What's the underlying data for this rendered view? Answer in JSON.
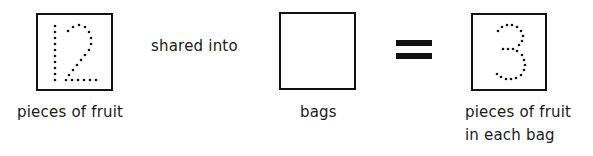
{
  "equation": {
    "dividend": {
      "value": "12",
      "style": "dotted-tracing",
      "label": "pieces of fruit"
    },
    "operator_text": "shared into",
    "divisor": {
      "value": "",
      "style": "empty-box",
      "label": "bags"
    },
    "equals_symbol": "=",
    "quotient": {
      "value": "3",
      "style": "dotted-tracing",
      "label_line1": "pieces of fruit",
      "label_line2": "in each bag"
    }
  },
  "colors": {
    "ink": "#111111",
    "background": "#ffffff"
  }
}
